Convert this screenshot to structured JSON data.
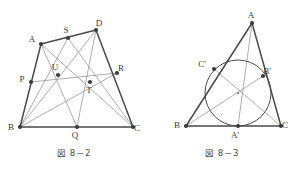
{
  "document": {
    "title": "Geometry figures 8-2 and 8-3",
    "background_color": "#ffffff",
    "ink_color": "#4a4a4a",
    "thin_line_color": "#8a8a8a",
    "point_color": "#3c3c3c"
  },
  "figures": [
    {
      "id": "figure-8-2",
      "caption": "図 8－2",
      "kind": "quadrilateral-with-cevians",
      "points": {
        "A": {
          "label": "A",
          "x": 41,
          "y": 44,
          "label_dx": -9,
          "label_dy": -2
        },
        "B": {
          "label": "B",
          "x": 20,
          "y": 127,
          "label_dx": -9,
          "label_dy": 3
        },
        "C": {
          "label": "C",
          "x": 133,
          "y": 127,
          "label_dx": 4,
          "label_dy": 4
        },
        "D": {
          "label": "D",
          "x": 96,
          "y": 30,
          "label_dx": 3,
          "label_dy": -4
        },
        "P": {
          "label": "P",
          "x": 31,
          "y": 82,
          "label_dx": -9,
          "label_dy": 0
        },
        "Q": {
          "label": "Q",
          "x": 77,
          "y": 127,
          "label_dx": -2,
          "label_dy": 11
        },
        "R": {
          "label": "R",
          "x": 117,
          "y": 73,
          "label_dx": 4,
          "label_dy": -2
        },
        "S": {
          "label": "S",
          "x": 68,
          "y": 38,
          "label_dx": -2,
          "label_dy": -5
        },
        "T": {
          "label": "T",
          "x": 90,
          "y": 82,
          "label_dx": -1,
          "label_dy": 11
        },
        "U": {
          "label": "U",
          "x": 58,
          "y": 75,
          "label_dx": -3,
          "label_dy": -5
        }
      },
      "outline_segments": [
        {
          "from": "A",
          "to": "D",
          "weight": "thick"
        },
        {
          "from": "D",
          "to": "C",
          "weight": "thick"
        },
        {
          "from": "C",
          "to": "B",
          "weight": "thick"
        },
        {
          "from": "B",
          "to": "A",
          "weight": "thick"
        }
      ],
      "cevian_segments": [
        {
          "from": "A",
          "to": "C",
          "weight": "thin"
        },
        {
          "from": "B",
          "to": "D",
          "weight": "thin"
        },
        {
          "from": "A",
          "to": "Q",
          "weight": "thin"
        },
        {
          "from": "D",
          "to": "Q",
          "weight": "thin"
        },
        {
          "from": "S",
          "to": "B",
          "weight": "thin"
        },
        {
          "from": "S",
          "to": "C",
          "weight": "thin"
        },
        {
          "from": "P",
          "to": "R",
          "weight": "thin"
        },
        {
          "from": "B",
          "to": "R",
          "weight": "thin"
        }
      ],
      "marked_points": [
        "A",
        "B",
        "C",
        "D",
        "P",
        "Q",
        "R",
        "S",
        "T",
        "U"
      ]
    },
    {
      "id": "figure-8-3",
      "caption": "図 8－3",
      "kind": "triangle-with-incircle",
      "points": {
        "A": {
          "label": "A",
          "x": 104,
          "y": 23,
          "label_dx": -1,
          "label_dy": -5
        },
        "B": {
          "label": "B",
          "x": 38,
          "y": 126,
          "label_dx": -9,
          "label_dy": 2
        },
        "C": {
          "label": "C",
          "x": 133,
          "y": 126,
          "label_dx": 4,
          "label_dy": 2
        },
        "Ap": {
          "label": "A'",
          "x": 90,
          "y": 126,
          "label_dx": -3,
          "label_dy": 12
        },
        "Bp": {
          "label": "B'",
          "x": 115,
          "y": 76,
          "label_dx": 4,
          "label_dy": -2
        },
        "Cp": {
          "label": "C'",
          "x": 66,
          "y": 69,
          "label_dx": -12,
          "label_dy": -2
        }
      },
      "incircle": {
        "cx": 90,
        "cy": 93,
        "r": 33,
        "center_marked": true
      },
      "outline_segments": [
        {
          "from": "A",
          "to": "B",
          "weight": "thick"
        },
        {
          "from": "A",
          "to": "C",
          "weight": "thick"
        },
        {
          "from": "B",
          "to": "C",
          "weight": "thick"
        }
      ],
      "cevian_segments": [
        {
          "from": "A",
          "to": "Ap",
          "weight": "thin"
        },
        {
          "from": "B",
          "to": "Bp",
          "weight": "thin"
        },
        {
          "from": "C",
          "to": "Cp",
          "weight": "thin"
        }
      ],
      "marked_points": [
        "A",
        "B",
        "C",
        "Ap",
        "Bp",
        "Cp"
      ]
    }
  ]
}
